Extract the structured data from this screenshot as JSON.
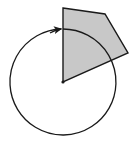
{
  "diagram": {
    "colors": {
      "background": "#ffffff",
      "shape_fill": "#c8c8c8",
      "stroke": "#1a1a1a"
    },
    "shape": {
      "type": "quadrilateral",
      "vertices": [
        [
          63,
          8
        ],
        [
          105,
          14
        ],
        [
          128,
          53
        ],
        [
          63,
          82
        ]
      ]
    },
    "rotation_center": [
      63,
      82
    ],
    "circle": {
      "cx": 63,
      "cy": 82,
      "r": 53,
      "direction": "clockwise",
      "arrowhead_at": [
        61,
        29
      ]
    }
  }
}
